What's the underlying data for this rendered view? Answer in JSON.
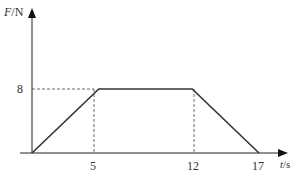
{
  "chart_data": {
    "type": "line",
    "title": "",
    "xlabel": "t/s",
    "ylabel": "F/N",
    "x_unit_var": "t",
    "x_unit": "/s",
    "y_unit_var": "F",
    "y_unit": "/N",
    "x": [
      0,
      5,
      12,
      17
    ],
    "series": [
      {
        "name": "F",
        "values": [
          0,
          8,
          8,
          0
        ]
      }
    ],
    "x_ticks": [
      "5",
      "12",
      "17"
    ],
    "y_ticks": [
      "8"
    ],
    "xlim": [
      0,
      19
    ],
    "ylim": [
      0,
      12
    ],
    "grid": false,
    "guide_lines": [
      {
        "type": "horizontal-dashed",
        "y": 8,
        "from_x": 0,
        "to_x": 5
      },
      {
        "type": "vertical-dashed",
        "x": 5,
        "from_y": 0,
        "to_y": 8
      },
      {
        "type": "vertical-dashed",
        "x": 12,
        "from_y": 0,
        "to_y": 8
      }
    ],
    "legend": null
  },
  "labels": {
    "y_axis_var": "F",
    "y_axis_unit": "/N",
    "x_axis_var": "t",
    "x_axis_unit": "/s",
    "tick_y_8": "8",
    "tick_x_5": "5",
    "tick_x_12": "12",
    "tick_x_17": "17"
  },
  "colors": {
    "axis": "#222222",
    "line": "#333333",
    "dashed": "#444444"
  }
}
